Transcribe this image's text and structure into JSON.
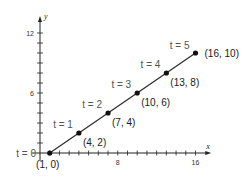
{
  "chart_data": {
    "type": "line",
    "title": "",
    "xlabel": "x",
    "ylabel": "y",
    "xlim": [
      0,
      17
    ],
    "ylim": [
      0,
      13
    ],
    "x_ticks": [
      8,
      16
    ],
    "y_ticks": [
      6,
      12
    ],
    "x_minor_step": 1,
    "y_minor_step": 1,
    "grid": false,
    "legend": null,
    "series": [
      {
        "name": "parametric line",
        "points": [
          {
            "t": 0,
            "x": 1,
            "y": 0,
            "label": "(1, 0)",
            "t_label": "t = 0"
          },
          {
            "t": 1,
            "x": 4,
            "y": 2,
            "label": "(4, 2)",
            "t_label": "t = 1"
          },
          {
            "t": 2,
            "x": 7,
            "y": 4,
            "label": "(7, 4)",
            "t_label": "t = 2"
          },
          {
            "t": 3,
            "x": 10,
            "y": 6,
            "label": "(10, 6)",
            "t_label": "t = 3"
          },
          {
            "t": 4,
            "x": 13,
            "y": 8,
            "label": "(13, 8)",
            "t_label": "t = 4"
          },
          {
            "t": 5,
            "x": 16,
            "y": 10,
            "label": "(16, 10)",
            "t_label": "t = 5"
          }
        ]
      }
    ]
  },
  "colors": {
    "line": "#333333",
    "point": "#111111",
    "axis": "#222222",
    "t_label": "#555555"
  }
}
